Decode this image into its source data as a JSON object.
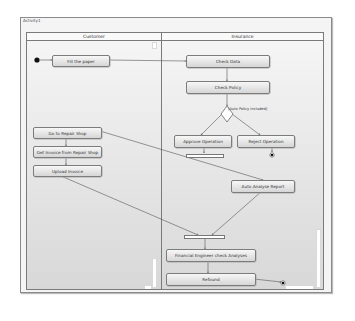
{
  "diagram": {
    "title": "Activity1",
    "lanes": [
      {
        "id": "customer",
        "label": "Customer"
      },
      {
        "id": "insurance",
        "label": "Insurance"
      }
    ],
    "actions": {
      "fill_paper": "Fill the paper",
      "check_data": "Check Data",
      "check_policy": "Check Policy",
      "approve_operation": "Approve Operation",
      "reject_operation": "Reject Operation",
      "go_repair_shop": "Go to Repair Shop",
      "get_invoice": "Get Invoice from Repair Shop",
      "upload_invoice": "Upload Invoice",
      "auto_analyse": "Auto Analyse Report",
      "financial_check": "Financial Engineer check Analyses",
      "refound": "Refound"
    },
    "decision_guard": "[Auto Policy Included]",
    "colors": {
      "border": "#7c7c7c",
      "node": "#000000",
      "edge": "#555555"
    }
  }
}
